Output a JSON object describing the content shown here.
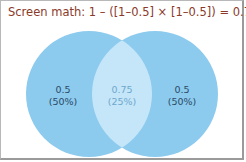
{
  "title": "Screen math: 1 – ([1–0.5] × [1–0.5]) = 0.75",
  "colors": {
    "circle": "#8ccaee",
    "overlap": "#c4e6f8",
    "title": "#8b3a2a",
    "side_text": "#2a4a66",
    "mid_text": "#6fa8cf"
  },
  "venn": {
    "left": {
      "value": "0.5",
      "percent": "(50%)"
    },
    "overlap": {
      "value": "0.75",
      "percent": "(25%)"
    },
    "right": {
      "value": "0.5",
      "percent": "(50%)"
    }
  }
}
